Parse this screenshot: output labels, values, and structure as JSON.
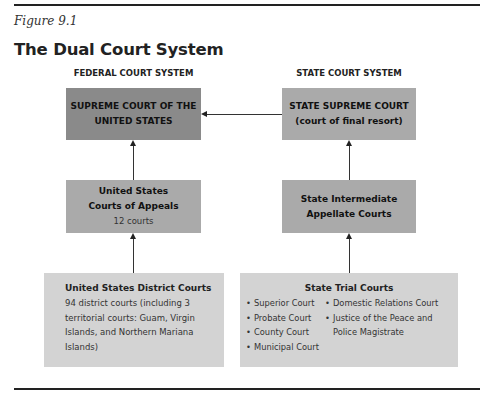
{
  "figure": {
    "label": "Figure 9.1",
    "title": "The Dual Court System"
  },
  "federal": {
    "heading": "FEDERAL COURT SYSTEM",
    "supreme": {
      "line1": "SUPREME COURT OF THE",
      "line2": "UNITED STATES"
    },
    "appeals": {
      "line1": "United States",
      "line2": "Courts of Appeals",
      "sub": "12 courts"
    },
    "district": {
      "title": "United States District Courts",
      "desc": "94 district courts (including 3 territorial courts: Guam, Virgin Islands, and Northern Mariana Islands)"
    }
  },
  "state": {
    "heading": "STATE COURT SYSTEM",
    "supreme": {
      "line1": "STATE SUPREME COURT",
      "line2": "(court of final resort)"
    },
    "intermediate": {
      "line1": "State Intermediate",
      "line2": "Appellate Courts"
    },
    "trial": {
      "title": "State Trial Courts",
      "bullet": "•",
      "col1": [
        "Superior Court",
        "Probate Court",
        "County Court",
        "Municipal Court"
      ],
      "col2": [
        "Domestic Relations Court",
        "Justice of the Peace and Police Magistrate"
      ]
    }
  },
  "colors": {
    "supreme_box": "#8a8a8a",
    "middle_box": "#aaaaaa",
    "bottom_box": "#d3d3d3"
  }
}
